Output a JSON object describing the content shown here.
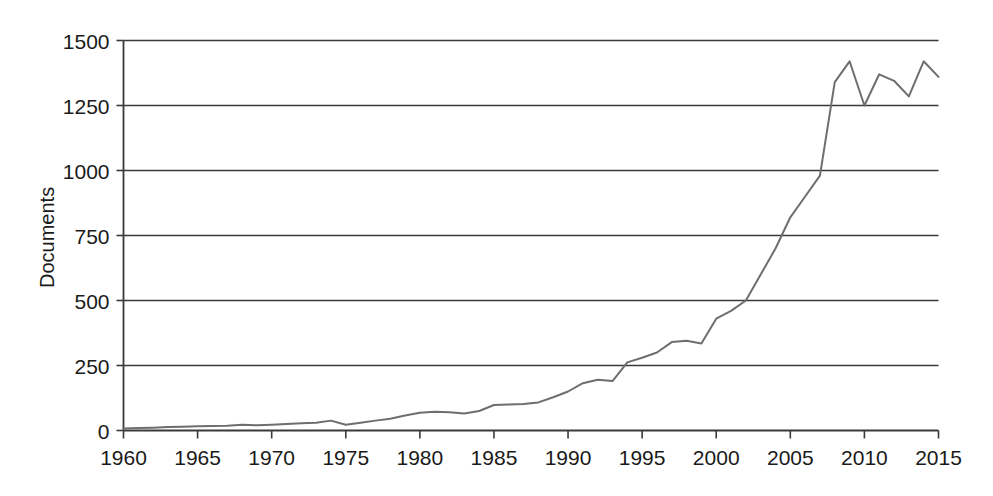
{
  "chart_data": {
    "type": "line",
    "title": "",
    "subtitle": "",
    "xlabel": "",
    "ylabel": "Documents",
    "xlim": [
      1960,
      2015
    ],
    "ylim": [
      0,
      1500
    ],
    "yticks": [
      0,
      250,
      500,
      750,
      1000,
      1250,
      1500
    ],
    "ytick_labels": [
      "0",
      "250",
      "500",
      "750",
      "1000",
      "1250",
      "1500"
    ],
    "xticks": [
      1960,
      1965,
      1970,
      1975,
      1980,
      1985,
      1990,
      1995,
      2000,
      2005,
      2010,
      2015
    ],
    "xtick_labels": [
      "1960",
      "1965",
      "1970",
      "1975",
      "1980",
      "1985",
      "1990",
      "1995",
      "2000",
      "2005",
      "2010",
      "2015"
    ],
    "grid": "horizontal",
    "legend": "none",
    "line_color": "#6e6e6e",
    "axis_color": "#3a3a3a",
    "background_color": "#ffffff",
    "series": [
      {
        "name": "Documents",
        "x": [
          1960,
          1961,
          1962,
          1963,
          1964,
          1965,
          1966,
          1967,
          1968,
          1969,
          1970,
          1971,
          1972,
          1973,
          1974,
          1975,
          1976,
          1977,
          1978,
          1979,
          1980,
          1981,
          1982,
          1983,
          1984,
          1985,
          1986,
          1987,
          1988,
          1989,
          1990,
          1991,
          1992,
          1993,
          1994,
          1995,
          1996,
          1997,
          1998,
          1999,
          2000,
          2001,
          2002,
          2003,
          2004,
          2005,
          2006,
          2007,
          2008,
          2009,
          2010,
          2011,
          2012,
          2013,
          2014,
          2015
        ],
        "values": [
          8,
          10,
          11,
          13,
          14,
          16,
          17,
          18,
          22,
          20,
          22,
          25,
          28,
          30,
          38,
          22,
          30,
          38,
          45,
          58,
          68,
          72,
          70,
          65,
          75,
          98,
          100,
          102,
          108,
          128,
          150,
          182,
          195,
          190,
          262,
          280,
          300,
          340,
          345,
          335,
          430,
          460,
          500,
          600,
          700,
          820,
          900,
          980,
          1340,
          1420,
          1250,
          1370,
          1345,
          1285,
          1420,
          1360
        ]
      }
    ],
    "annotations": []
  },
  "axes": {
    "y_axis_title": "Documents"
  }
}
